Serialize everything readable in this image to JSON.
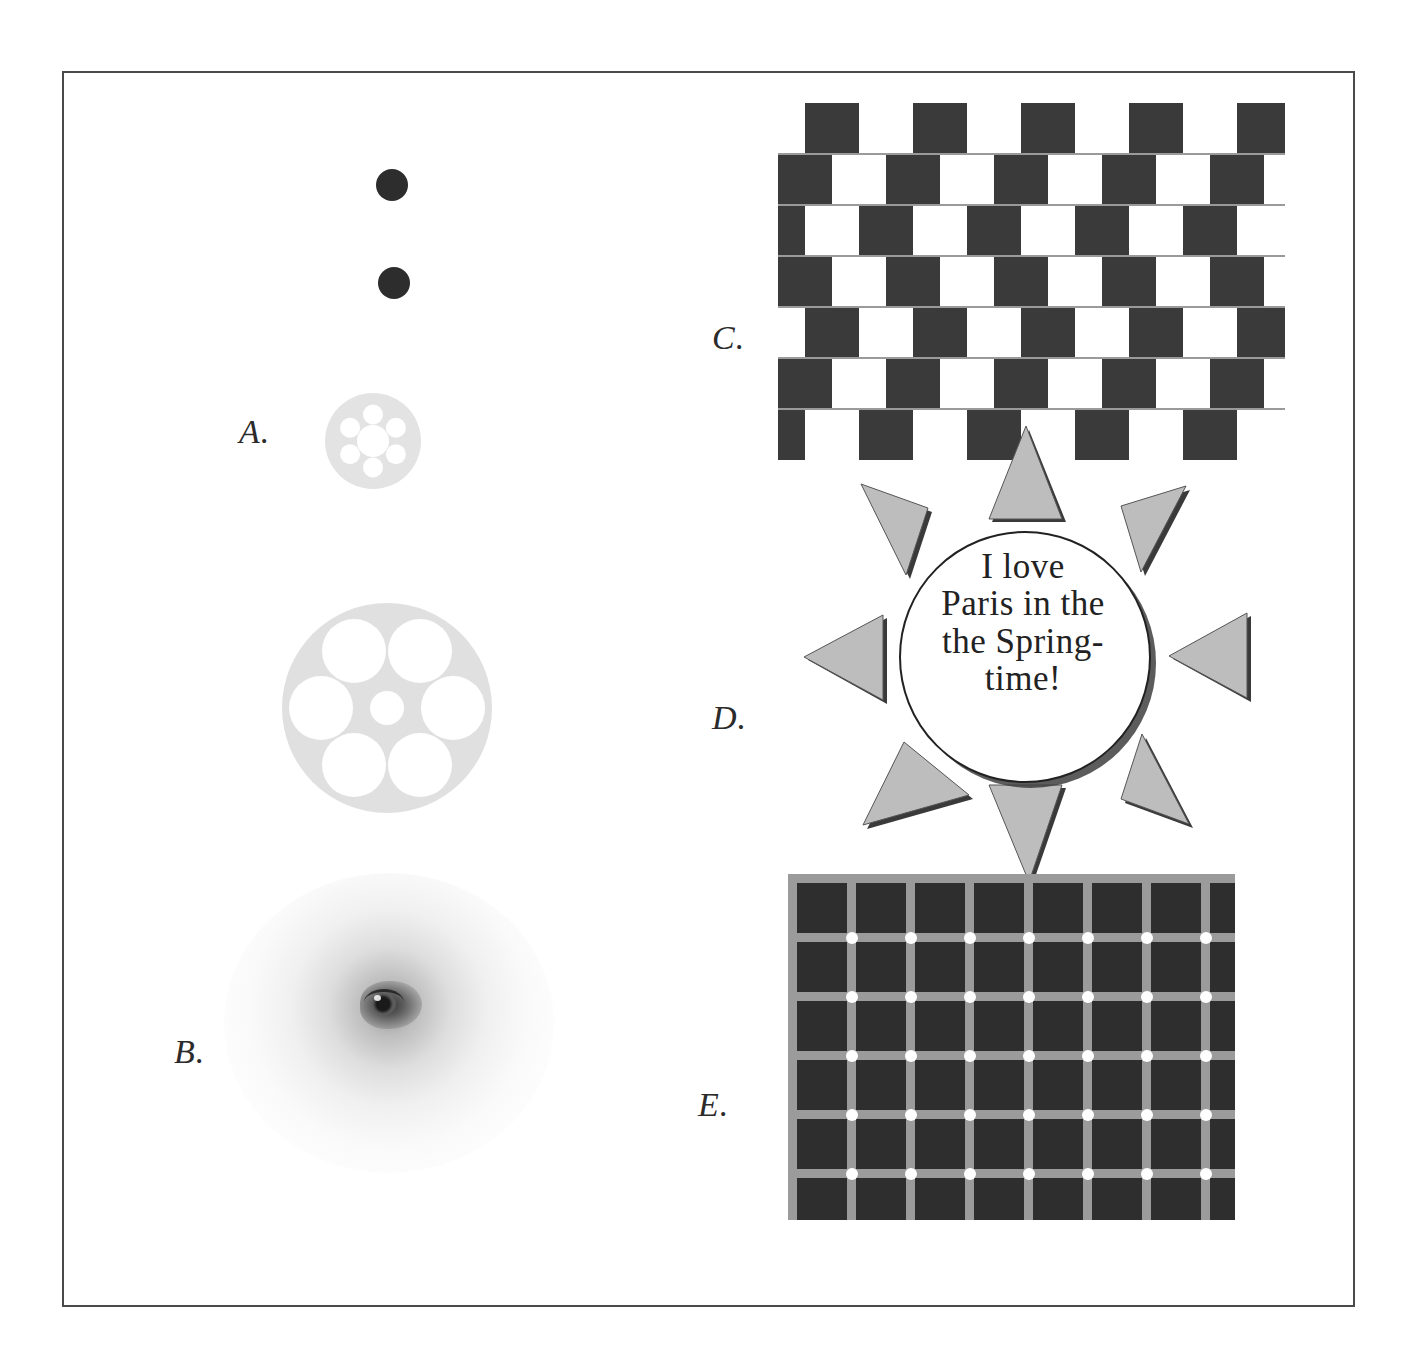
{
  "figure": {
    "title": "",
    "background_color": "#ffffff",
    "frame_color": "#4a4a4a"
  },
  "panels": [
    {
      "key": "A",
      "label": "A.",
      "name": "illusion-panel-a-circles",
      "description": "Delboeuf / Ebbinghaus size-contrast rings with dots"
    },
    {
      "key": "B",
      "label": "B.",
      "name": "illusion-panel-b-blurred-eye",
      "description": "Blurred eye / peripheral acuity"
    },
    {
      "key": "C",
      "label": "C.",
      "name": "illusion-panel-c-cafe-wall",
      "description": "Cafe wall illusion"
    },
    {
      "key": "D",
      "label": "D.",
      "name": "illusion-panel-d-paris-spring",
      "description": "Proofreading / duplicated word illusion in a sunburst"
    },
    {
      "key": "E",
      "label": "E.",
      "name": "illusion-panel-e-scintillating-grid",
      "description": "Scintillating grid illusion"
    }
  ],
  "panel_a": {
    "label": "A.",
    "dot_color": "#2d2d2d",
    "ring_fill": "#e3e3e3",
    "hole_fill": "#ffffff",
    "dots": [
      {
        "cx": 390,
        "cy": 183,
        "r": 16
      },
      {
        "cx": 392,
        "cy": 281,
        "r": 16
      }
    ],
    "small_ring": {
      "cx": 385,
      "cy": 437,
      "r": 48,
      "center_hole_r": 16,
      "satellite_hole_r": 10,
      "satellite_count": 6
    },
    "large_ring": {
      "cx": 383,
      "cy": 705,
      "r": 105,
      "center_hole_r": 17,
      "satellite_hole_r": 32,
      "satellite_count": 6
    }
  },
  "panel_b": {
    "label": "B."
  },
  "panel_c": {
    "label": "C.",
    "dark_color": "#3a3a3a",
    "light_color": "#ffffff",
    "mortar_color": "#9a9a9a",
    "tile_width": 54,
    "tile_height": 51,
    "row_count": 7,
    "row_offsets": [
      27,
      0,
      -27,
      0,
      27,
      0,
      -27
    ]
  },
  "panel_d": {
    "label": "D.",
    "text_lines": [
      "I love",
      "Paris in the",
      "the Spring-",
      "time!"
    ],
    "text_color": "#222222",
    "circle_stroke": "#222222",
    "circle_fill": "#ffffff",
    "ray_fill": "#bdbdbd",
    "ray_stroke": "#3a3a3a",
    "ray_count": 8
  },
  "panel_e": {
    "label": "E.",
    "cell_color": "#2e2e2e",
    "line_color": "#9b9b9b",
    "dot_color": "#ffffff",
    "columns": 8,
    "rows": 7,
    "cell_size": 50,
    "line_width": 9,
    "dot_radius": 6
  }
}
